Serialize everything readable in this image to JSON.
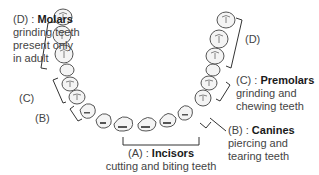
{
  "diagram": {
    "labels": {
      "molars": {
        "code": "(D) : ",
        "name": "Molars",
        "desc1": "grinding teeth",
        "desc2": "present only",
        "desc3": "in adult"
      },
      "premolars": {
        "code": "(C) : ",
        "name": "Premolars",
        "desc1": "grinding and",
        "desc2": "chewing teeth"
      },
      "canines": {
        "code": "(B) : ",
        "name": "Canines",
        "desc1": "piercing and",
        "desc2": "tearing teeth"
      },
      "incisors": {
        "code": "(A) : ",
        "name": "Incisors",
        "desc1": "cutting and biting teeth"
      }
    },
    "bracket_tags": {
      "left_d": "",
      "left_c": "(C)",
      "left_b": "(B)",
      "right_d": "(D)"
    }
  }
}
